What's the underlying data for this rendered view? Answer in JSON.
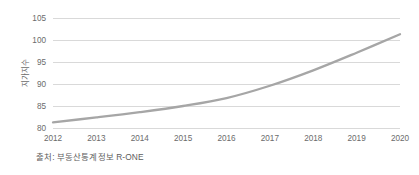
{
  "chart_data": {
    "type": "line",
    "title": "",
    "xlabel": "",
    "ylabel": "지가지수",
    "categories": [
      "2012",
      "2013",
      "2014",
      "2015",
      "2016",
      "2017",
      "2018",
      "2019",
      "2020"
    ],
    "x": [
      2012,
      2013,
      2014,
      2015,
      2016,
      2017,
      2018,
      2019,
      2020
    ],
    "values": [
      81.3,
      82.4,
      83.6,
      85.0,
      86.8,
      89.6,
      93.1,
      97.1,
      101.3
    ],
    "series": [
      {
        "name": "지가지수",
        "values": [
          81.3,
          82.4,
          83.6,
          85.0,
          86.8,
          89.6,
          93.1,
          97.1,
          101.3
        ],
        "color": "#a6a6a6"
      }
    ],
    "ylim": [
      79.0,
      106.5
    ],
    "yticks": [
      80,
      85,
      90,
      95,
      100,
      105
    ],
    "ytick_labels": [
      "80",
      "85",
      "90",
      "95",
      "100",
      "105"
    ],
    "xtick_labels": [
      "2012",
      "2013",
      "2014",
      "2015",
      "2016",
      "2017",
      "2018",
      "2019",
      "2020"
    ],
    "grid": "horizontal",
    "legend": "none",
    "line_color": "#a6a6a6",
    "grid_color": "#d9d9d9",
    "tick_color": "#6b6b6b",
    "background": "#ffffff"
  },
  "source": {
    "note": "출처: 부동산통계정보 R-ONE"
  }
}
